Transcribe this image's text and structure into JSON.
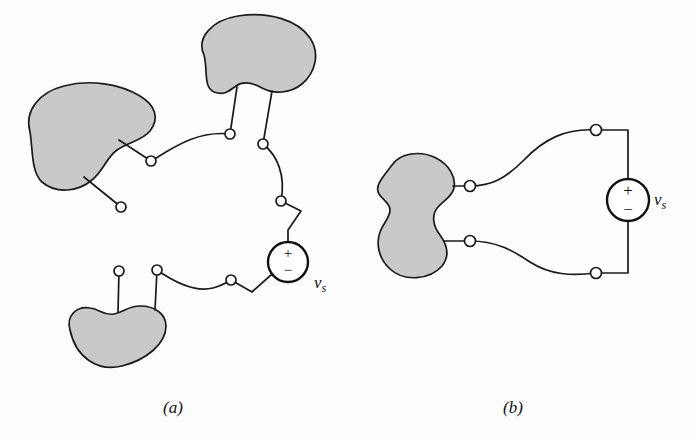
{
  "figure": {
    "background_color": "#fdfdfd",
    "stroke_color": "#1a1a1a",
    "blob_fill_color": "#c9c9c9",
    "node_fill_color": "#ffffff",
    "width": 696,
    "height": 442
  },
  "panels": [
    {
      "id": "a",
      "caption": "(a)",
      "description": "Four separate shaded network blobs connected by irregular wires through open terminal nodes to a voltage source",
      "blob_count": 3,
      "node_count": 9,
      "source": {
        "label": "v",
        "subscript": "s",
        "plus": "+",
        "minus": "−",
        "cx": 288,
        "cy": 262,
        "r": 20
      },
      "blobs": [
        {
          "name": "left-network-blob",
          "cx": 72,
          "cy": 140
        },
        {
          "name": "top-network-blob",
          "cx": 250,
          "cy": 62
        },
        {
          "name": "bottom-network-blob",
          "cx": 115,
          "cy": 335
        }
      ],
      "nodes": [
        {
          "name": "node-left-upper",
          "cx": 151,
          "cy": 161
        },
        {
          "name": "node-left-lower",
          "cx": 121,
          "cy": 207
        },
        {
          "name": "node-top-left",
          "cx": 230,
          "cy": 134
        },
        {
          "name": "node-top-right",
          "cx": 263,
          "cy": 144
        },
        {
          "name": "node-mid-right",
          "cx": 281,
          "cy": 201
        },
        {
          "name": "node-bottom-left",
          "cx": 119,
          "cy": 271
        },
        {
          "name": "node-bottom-mid",
          "cx": 157,
          "cy": 270
        },
        {
          "name": "node-bottom-right",
          "cx": 231,
          "cy": 280
        }
      ]
    },
    {
      "id": "b",
      "caption": "(b)",
      "description": "Single shaded network blob with two terminals connected through nodes to a voltage source",
      "blob_count": 1,
      "node_count": 4,
      "source": {
        "label": "v",
        "subscript": "s",
        "plus": "+",
        "minus": "−",
        "cx": 628,
        "cy": 200,
        "r": 21
      },
      "blobs": [
        {
          "name": "single-network-blob",
          "cx": 420,
          "cy": 215
        }
      ],
      "nodes": [
        {
          "name": "node-upper-terminal",
          "cx": 470,
          "cy": 186
        },
        {
          "name": "node-upper-corner",
          "cx": 596,
          "cy": 130
        },
        {
          "name": "node-lower-terminal",
          "cx": 470,
          "cy": 241
        },
        {
          "name": "node-lower-corner",
          "cx": 596,
          "cy": 273
        }
      ]
    }
  ],
  "labels": {
    "caption_a": "(a)",
    "caption_b": "(b)",
    "vs_a_base": "v",
    "vs_a_sub": "s",
    "vs_b_base": "v",
    "vs_b_sub": "s",
    "plus_sign": "+",
    "minus_sign": "−"
  }
}
